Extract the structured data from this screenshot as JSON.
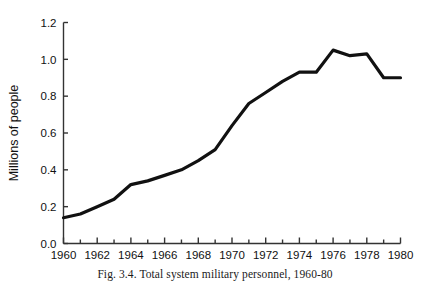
{
  "figure": {
    "caption": "Fig. 3.4. Total system military personnel, 1960-80",
    "background_color": "#ffffff",
    "line_color": "#111111",
    "axis_color": "#333333"
  },
  "chart_data": {
    "type": "line",
    "title": "",
    "subtitle": "",
    "xlabel": "",
    "ylabel": "Millions of people",
    "xlim": [
      1960,
      1980
    ],
    "ylim": [
      0.0,
      1.2
    ],
    "grid": false,
    "legend": null,
    "legend_position": "none",
    "x_tick_labels": [
      "1960",
      "1962",
      "1964",
      "1966",
      "1968",
      "1970",
      "1972",
      "1974",
      "1976",
      "1978",
      "1980"
    ],
    "x_tick_values": [
      1960,
      1962,
      1964,
      1966,
      1968,
      1970,
      1972,
      1974,
      1976,
      1978,
      1980
    ],
    "x_minor_tick_interval": 1,
    "y_tick_labels": [
      "0.0",
      "0.2",
      "0.4",
      "0.6",
      "0.8",
      "1.0",
      "1.2"
    ],
    "y_tick_values": [
      0.0,
      0.2,
      0.4,
      0.6,
      0.8,
      1.0,
      1.2
    ],
    "x": [
      1960,
      1961,
      1962,
      1963,
      1964,
      1965,
      1966,
      1967,
      1968,
      1969,
      1970,
      1971,
      1972,
      1973,
      1974,
      1975,
      1976,
      1977,
      1978,
      1979,
      1980
    ],
    "values": [
      0.14,
      0.16,
      0.2,
      0.24,
      0.32,
      0.34,
      0.37,
      0.4,
      0.45,
      0.51,
      0.64,
      0.76,
      0.82,
      0.88,
      0.93,
      0.93,
      1.05,
      1.02,
      1.03,
      0.9,
      0.9
    ],
    "series": [
      {
        "name": "Total system military personnel",
        "values": [
          0.14,
          0.16,
          0.2,
          0.24,
          0.32,
          0.34,
          0.37,
          0.4,
          0.45,
          0.51,
          0.64,
          0.76,
          0.82,
          0.88,
          0.93,
          0.93,
          1.05,
          1.02,
          1.03,
          0.9,
          0.9
        ]
      }
    ]
  }
}
